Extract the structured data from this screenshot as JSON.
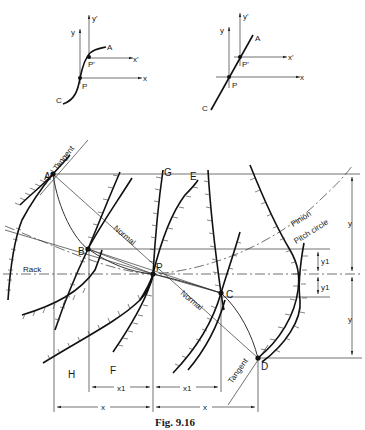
{
  "figure": {
    "caption": "Fig. 9.16",
    "inset_left": {
      "axes": {
        "x": "x",
        "y": "y",
        "x_prime": "x'",
        "y_prime": "y'"
      },
      "points": {
        "a": "A",
        "c": "C",
        "p": "P",
        "p_prime": "P'"
      },
      "curve_type": "curved"
    },
    "inset_right": {
      "axes": {
        "x": "x",
        "y": "y",
        "x_prime": "x'",
        "y_prime": "y'"
      },
      "points": {
        "a": "A",
        "c": "C",
        "p": "P",
        "p_prime": "P'"
      },
      "curve_type": "straight"
    },
    "main": {
      "points": {
        "a": "A",
        "b": "B",
        "p": "P",
        "c": "C",
        "d": "D",
        "e": "E",
        "f": "F",
        "g": "G",
        "h": "H"
      },
      "labels": {
        "tangent_top": "Tangent",
        "tangent_bottom": "Tangent",
        "normal_top": "Normal",
        "normal_bottom": "Normal",
        "rack": "Rack",
        "pinion": "Pinion",
        "pitch_circle": "Pitch circle"
      },
      "dimensions": {
        "y_upper": "y",
        "y_lower": "y",
        "y1_upper": "y1",
        "y1_lower": "y1",
        "x1_left": "x1",
        "x1_right": "x1",
        "x_left": "x",
        "x_right": "x"
      }
    }
  }
}
